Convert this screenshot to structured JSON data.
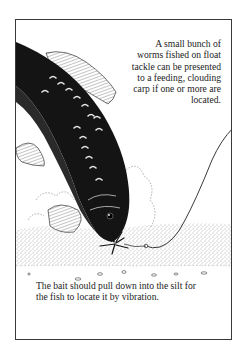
{
  "page": {
    "type": "book-illustration-plate",
    "frame_color": "#3a3a3a",
    "ink_color": "#1c1c1c"
  },
  "captions": {
    "top": {
      "lines": [
        "A small bunch of",
        "worms fished on float",
        "tackle can be presented",
        "to a feeding, clouding",
        "carp if one or more are",
        "located."
      ]
    },
    "bottom": {
      "lines": [
        "The bait should pull down into the silt for",
        "the fish to locate it by vibration."
      ]
    }
  },
  "illustration": {
    "subject": "carp-feeding-on-worm-bait",
    "elements": [
      "carp",
      "fishing-line",
      "worm-bunch",
      "hook",
      "silt-bed",
      "silt-cloud",
      "pebbles"
    ]
  }
}
